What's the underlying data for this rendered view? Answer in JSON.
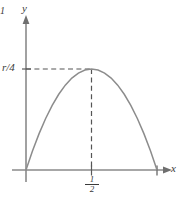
{
  "chart_data": {
    "type": "line",
    "title": "",
    "subtitle": "",
    "xlabel": "x",
    "ylabel": "y",
    "xlim": [
      -0.2,
      1.18
    ],
    "ylim": [
      -0.12,
      1.22
    ],
    "grid": false,
    "legend": null,
    "series": [
      {
        "name": "rx(1-x)",
        "x": [
          0.0,
          0.05,
          0.1,
          0.15,
          0.2,
          0.25,
          0.3,
          0.35,
          0.4,
          0.45,
          0.5,
          0.55,
          0.6,
          0.65,
          0.7,
          0.75,
          0.8,
          0.85,
          0.9,
          0.95,
          1.0
        ],
        "y": [
          0.0,
          0.19,
          0.36,
          0.51,
          0.64,
          0.75,
          0.84,
          0.91,
          0.96,
          0.99,
          1.0,
          0.99,
          0.96,
          0.91,
          0.84,
          0.75,
          0.64,
          0.51,
          0.36,
          0.19,
          0.0
        ],
        "color": "#8c8c8c"
      }
    ],
    "x_ticks": [
      {
        "value": 0.5,
        "label": "1/2",
        "numerator": "1",
        "denominator": "2"
      },
      {
        "value": 1.0,
        "label": "1"
      }
    ],
    "y_ticks": [
      {
        "value": 1.0,
        "label": "r/4"
      }
    ],
    "annotations": {
      "peak_point": {
        "x": 0.5,
        "y": 1.0
      },
      "guide_horizontal": {
        "from_x": 0.0,
        "to_x": 0.5,
        "at_y": 1.0,
        "style": "dashed"
      },
      "guide_vertical": {
        "at_x": 0.5,
        "from_y": 0.0,
        "to_y": 1.0,
        "style": "dashed"
      }
    },
    "colors": {
      "curve": "#8c8c8c",
      "axis": "#8a8a8a",
      "dash": "#5a5a5a",
      "text": "#3a3a3a",
      "background": "#ffffff"
    }
  },
  "labels": {
    "y_axis": "y",
    "x_axis": "x",
    "y_tick_r4": "r/4",
    "x_tick_one": "1",
    "x_tick_half_numerator": "1",
    "x_tick_half_denominator": "2"
  }
}
